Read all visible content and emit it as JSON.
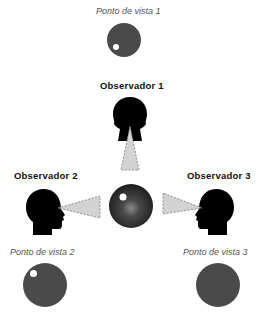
{
  "labels": {
    "viewpoint1": "Ponto de vista 1",
    "viewpoint2": "Ponto de vista 2",
    "viewpoint3": "Ponto de vista 3",
    "observer1": "Observador 1",
    "observer2": "Observador 2",
    "observer3": "Observador 3"
  },
  "colors": {
    "disc": "#4a4a4a",
    "head": "#000000",
    "cone": "#d0d0d0",
    "highlight": "#ffffff"
  }
}
